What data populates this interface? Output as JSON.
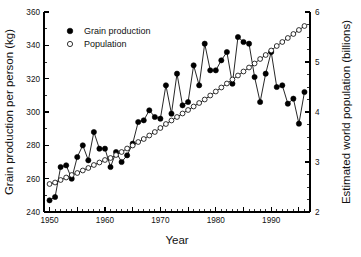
{
  "chart_data": {
    "type": "line",
    "title": "",
    "xlabel": "Year",
    "ylabel": "Grain production per person (kg)",
    "y2label": "Estimated world population (billions)",
    "xlim": [
      1949,
      1997
    ],
    "ylim": [
      240,
      360
    ],
    "y2lim": [
      2,
      6
    ],
    "xticks": [
      1950,
      1960,
      1970,
      1980,
      1990
    ],
    "xtick_labels": [
      "1950",
      "1960",
      "1970",
      "1980",
      "1990"
    ],
    "yticks": [
      240,
      260,
      280,
      300,
      320,
      340,
      360
    ],
    "ytick_labels": [
      "240",
      "260",
      "280",
      "300",
      "320",
      "340",
      "360"
    ],
    "y2ticks": [
      2,
      3,
      4,
      5,
      6
    ],
    "y2tick_labels": [
      "2",
      "3",
      "4",
      "5",
      "6"
    ],
    "xtick_minor_step": 1,
    "ytick_minor_step": 10,
    "y2tick_minor_step": 0.25,
    "grid": false,
    "legend_position": "top-left",
    "marker_colors": {
      "grain": "#000000",
      "population_fill": "#ffffff",
      "population_edge": "#000000"
    },
    "series": [
      {
        "name": "Grain production",
        "marker": "filled-circle",
        "axis": "left",
        "x": [
          1950,
          1951,
          1952,
          1953,
          1954,
          1955,
          1956,
          1957,
          1958,
          1959,
          1960,
          1961,
          1962,
          1963,
          1964,
          1965,
          1966,
          1967,
          1968,
          1969,
          1970,
          1971,
          1972,
          1973,
          1974,
          1975,
          1976,
          1977,
          1978,
          1979,
          1980,
          1981,
          1982,
          1983,
          1984,
          1985,
          1986,
          1987,
          1988,
          1989,
          1990,
          1991,
          1992,
          1993,
          1994,
          1995,
          1996
        ],
        "values": [
          247,
          249,
          267,
          268,
          260,
          273,
          280,
          271,
          288,
          278,
          278,
          267,
          276,
          270,
          274,
          281,
          294,
          295,
          301,
          297,
          296,
          316,
          299,
          323,
          304,
          306,
          328,
          316,
          341,
          325,
          325,
          331,
          336,
          317,
          345,
          342,
          341,
          321,
          306,
          323,
          336,
          315,
          316,
          305,
          308,
          293,
          312
        ]
      },
      {
        "name": "Population",
        "marker": "open-circle",
        "axis": "right",
        "x": [
          1950,
          1951,
          1952,
          1953,
          1954,
          1955,
          1956,
          1957,
          1958,
          1959,
          1960,
          1961,
          1962,
          1963,
          1964,
          1965,
          1966,
          1967,
          1968,
          1969,
          1970,
          1971,
          1972,
          1973,
          1974,
          1975,
          1976,
          1977,
          1978,
          1979,
          1980,
          1981,
          1982,
          1983,
          1984,
          1985,
          1986,
          1987,
          1988,
          1989,
          1990,
          1991,
          1992,
          1993,
          1994,
          1995,
          1996
        ],
        "values": [
          2.56,
          2.59,
          2.64,
          2.69,
          2.74,
          2.78,
          2.83,
          2.88,
          2.94,
          2.99,
          3.04,
          3.08,
          3.14,
          3.2,
          3.27,
          3.33,
          3.4,
          3.46,
          3.53,
          3.6,
          3.68,
          3.76,
          3.83,
          3.9,
          3.97,
          4.04,
          4.11,
          4.18,
          4.25,
          4.33,
          4.41,
          4.49,
          4.57,
          4.65,
          4.73,
          4.81,
          4.89,
          4.97,
          5.06,
          5.14,
          5.23,
          5.32,
          5.4,
          5.48,
          5.56,
          5.64,
          5.72
        ]
      }
    ],
    "legend_entries": [
      {
        "label": "Grain production",
        "marker": "filled-circle"
      },
      {
        "label": "Population",
        "marker": "open-circle"
      }
    ]
  },
  "caption": ""
}
